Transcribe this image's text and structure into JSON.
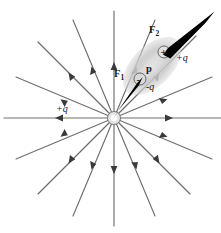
{
  "figure": {
    "background_color": "#ffffff",
    "width": 221,
    "height": 233
  },
  "colors": {
    "field_line": "#6e6e6e",
    "arrowhead": "#3a3a3a",
    "force_arrow": "#000000",
    "dipole_blob": "#c9c9c9",
    "dipole_blob_inner": "#bdbdbd",
    "charge_fill": "#dcdcdc",
    "charge_stroke": "#555555",
    "text": "#1a1a1a"
  },
  "source_charge": {
    "label": "+q",
    "sign_glyph": "+",
    "center_x": 114,
    "center_y": 118,
    "label_x": 62,
    "label_y": 110
  },
  "field": {
    "type": "radial-outward",
    "line_count": 16,
    "angles_deg": [
      0,
      22.5,
      45,
      67.5,
      90,
      112.5,
      135,
      157.5,
      180,
      202.5,
      225,
      247.5,
      270,
      292.5,
      315,
      337.5
    ],
    "arrow_direction": "outward",
    "arrow_fraction": 0.5
  },
  "dipole": {
    "moment_label": "p",
    "positive_charge": {
      "label": "+q",
      "sign_glyph": "+",
      "x": 164,
      "y": 52
    },
    "negative_charge": {
      "label": "-q",
      "sign_glyph": "-",
      "x": 140,
      "y": 79
    },
    "moment_label_x": 147,
    "moment_label_y": 70,
    "blob_angle_deg": -45
  },
  "forces": [
    {
      "name": "F1",
      "label": "F",
      "subscript": "1",
      "description": "force on negative charge, directed toward source charge",
      "label_x": 117,
      "label_y": 74,
      "tail_x": 141,
      "tail_y": 80,
      "tip_x": 115,
      "tip_y": 117
    },
    {
      "name": "F2",
      "label": "F",
      "subscript": "2",
      "description": "force on positive charge, directed away from source charge",
      "label_x": 152,
      "label_y": 30,
      "tail_x": 165,
      "tail_y": 51,
      "tip_x": 213,
      "tip_y": 13
    }
  ]
}
